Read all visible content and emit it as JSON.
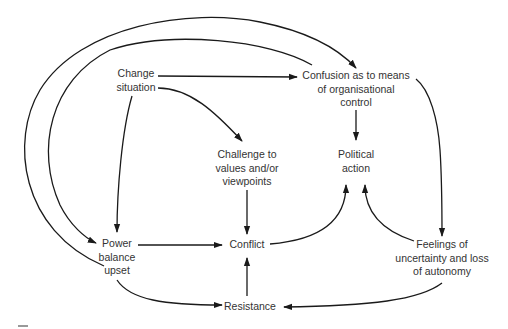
{
  "diagram": {
    "type": "causal-flow",
    "nodes": [
      {
        "id": "change",
        "lines": [
          "Change",
          "situation"
        ]
      },
      {
        "id": "confusion",
        "lines": [
          "Confusion as to means",
          "of organisational",
          "control"
        ]
      },
      {
        "id": "challenge",
        "lines": [
          "Challenge to",
          "values and/or",
          "viewpoints"
        ]
      },
      {
        "id": "political",
        "lines": [
          "Political",
          "action"
        ]
      },
      {
        "id": "power",
        "lines": [
          "Power",
          "balance",
          "upset"
        ]
      },
      {
        "id": "conflict",
        "lines": [
          "Conflict"
        ]
      },
      {
        "id": "feelings",
        "lines": [
          "Feelings of",
          "uncertainty and loss",
          "of autonomy"
        ]
      },
      {
        "id": "resistance",
        "lines": [
          "Resistance"
        ]
      }
    ],
    "edges": [
      {
        "from": "change",
        "to": "confusion"
      },
      {
        "from": "change",
        "to": "challenge"
      },
      {
        "from": "change",
        "to": "power"
      },
      {
        "from": "confusion",
        "to": "political"
      },
      {
        "from": "confusion",
        "to": "feelings"
      },
      {
        "from": "confusion",
        "to": "power"
      },
      {
        "from": "power",
        "to": "confusion"
      },
      {
        "from": "challenge",
        "to": "conflict"
      },
      {
        "from": "power",
        "to": "conflict"
      },
      {
        "from": "power",
        "to": "resistance"
      },
      {
        "from": "conflict",
        "to": "political"
      },
      {
        "from": "feelings",
        "to": "political"
      },
      {
        "from": "feelings",
        "to": "resistance"
      },
      {
        "from": "resistance",
        "to": "conflict"
      }
    ]
  }
}
